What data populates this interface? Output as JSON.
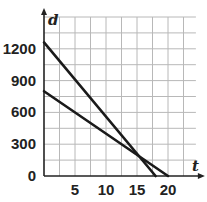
{
  "chart_data": {
    "type": "line",
    "title": "",
    "xlabel": "t",
    "ylabel": "d",
    "xlim": [
      0,
      25
    ],
    "ylim": [
      0,
      1500
    ],
    "grid": true,
    "x_grid_step": 2.5,
    "y_grid_step": 150,
    "x_ticks": [
      5,
      10,
      15,
      20
    ],
    "x_tick_labels": [
      "5",
      "10",
      "15",
      "20"
    ],
    "y_ticks": [
      0,
      300,
      600,
      900,
      1200
    ],
    "y_tick_labels": [
      "0",
      "300",
      "600",
      "900",
      "1200"
    ],
    "legend": null,
    "series": [
      {
        "name": "line-1",
        "x": [
          0,
          18
        ],
        "y": [
          1260,
          0
        ],
        "color": "#1a1a1a"
      },
      {
        "name": "line-2",
        "x": [
          0,
          20
        ],
        "y": [
          800,
          0
        ],
        "color": "#1a1a1a"
      }
    ],
    "annotations": []
  },
  "colors": {
    "grid": "#b8b8b8",
    "axis": "#222222",
    "line": "#1a1a1a"
  }
}
